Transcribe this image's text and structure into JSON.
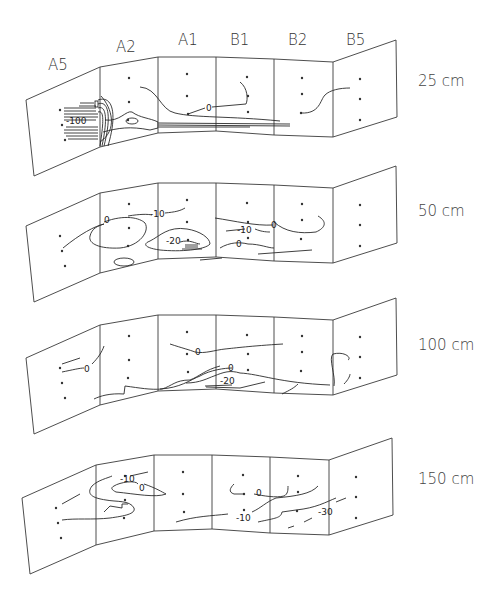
{
  "columns": [
    {
      "id": "A5",
      "label": "A5"
    },
    {
      "id": "A2",
      "label": "A2"
    },
    {
      "id": "A1",
      "label": "A1"
    },
    {
      "id": "B1",
      "label": "B1"
    },
    {
      "id": "B2",
      "label": "B2"
    },
    {
      "id": "B5",
      "label": "B5"
    }
  ],
  "strips": [
    {
      "depth_label": "25 cm",
      "contour_labels": [
        "-100",
        "0"
      ]
    },
    {
      "depth_label": "50 cm",
      "contour_labels": [
        "0",
        "-10",
        "-20",
        "-10",
        "0",
        "0"
      ]
    },
    {
      "depth_label": "100 cm",
      "contour_labels": [
        "0",
        "0",
        "0",
        "-20"
      ]
    },
    {
      "depth_label": "150 cm",
      "contour_labels": [
        "-10",
        "0",
        "0",
        "-10",
        "-30"
      ]
    }
  ],
  "colors": {
    "line": "#2a2a2a",
    "background": "#ffffff"
  }
}
